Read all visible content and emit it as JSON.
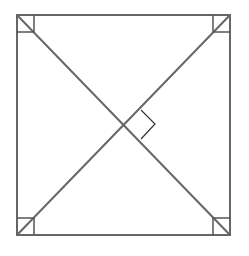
{
  "diagram": {
    "type": "square-with-diagonals",
    "stroke_color": "#666666",
    "marker_color": "#333333",
    "background": "#ffffff",
    "square": {
      "x1": 17,
      "y1": 15,
      "x2": 230,
      "y2": 235
    },
    "diagonals": [
      {
        "name": "diagonal-tl-br",
        "from": [
          17,
          15
        ],
        "to": [
          230,
          235
        ]
      },
      {
        "name": "diagonal-bl-tr",
        "from": [
          17,
          235
        ],
        "to": [
          230,
          15
        ]
      }
    ],
    "right_angle_markers": [
      "top-left",
      "top-right",
      "bottom-left",
      "bottom-right",
      "center-intersection"
    ],
    "labels": []
  }
}
